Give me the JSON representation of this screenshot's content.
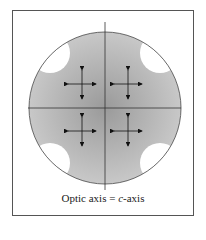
{
  "diagram": {
    "caption_prefix": "Optic axis = ",
    "caption_italic": "c",
    "caption_suffix": "-axis",
    "colors": {
      "fill_center": "#9a9a9a",
      "fill_edge": "#c8c8c8",
      "line": "#333333"
    }
  }
}
